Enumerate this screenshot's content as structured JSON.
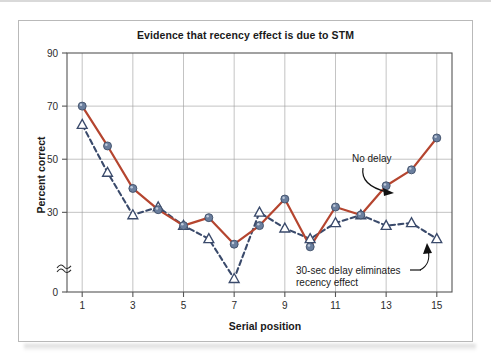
{
  "chart_data": {
    "type": "line",
    "title": "Evidence that recency effect is due to STM",
    "xlabel": "Serial position",
    "ylabel": "Percent correct",
    "x": [
      1,
      2,
      3,
      4,
      5,
      6,
      7,
      8,
      9,
      10,
      11,
      12,
      13,
      14,
      15
    ],
    "xlim": [
      0.4,
      15.6
    ],
    "ylim": [
      0,
      90
    ],
    "xticks": [
      "1",
      "3",
      "5",
      "7",
      "9",
      "11",
      "13",
      "15"
    ],
    "xtick_values": [
      1,
      3,
      5,
      7,
      9,
      11,
      13,
      15
    ],
    "yticks": [
      "0",
      "30",
      "50",
      "70",
      "90"
    ],
    "ytick_values": [
      0,
      30,
      50,
      70,
      90
    ],
    "y_axis_break": true,
    "grid": "both",
    "legend_position": "annotations-inline",
    "series": [
      {
        "name": "No delay",
        "style": "solid",
        "color": "#b5452f",
        "marker": "circle",
        "marker_color": "#6b7f9e",
        "values": [
          70,
          55,
          39,
          31,
          25,
          28,
          18,
          25,
          35,
          17,
          32,
          29,
          40,
          46,
          58
        ]
      },
      {
        "name": "30-sec delay eliminates recency effect",
        "style": "dashed",
        "color": "#3a4a6b",
        "marker": "triangle",
        "marker_color": "#ffffff",
        "values": [
          63,
          45,
          29,
          32,
          25,
          20,
          5,
          30,
          24,
          20,
          26,
          29,
          25,
          26,
          20
        ]
      }
    ],
    "annotations": [
      {
        "text": "No delay",
        "target_series": "No delay",
        "target_x": 13
      },
      {
        "text_line1": "30-sec delay eliminates",
        "text_line2": "recency effect",
        "target_series": "30-sec delay eliminates recency effect",
        "target_x": 14
      }
    ],
    "colors": {
      "solid_line": "#b5452f",
      "dashed_line": "#3a4a6b",
      "circle_marker": "#6b7f9e",
      "grid": "#9a9a9a",
      "axis": "#555555",
      "frame": "#b9b9b9",
      "text": "#1a1a1a"
    }
  }
}
